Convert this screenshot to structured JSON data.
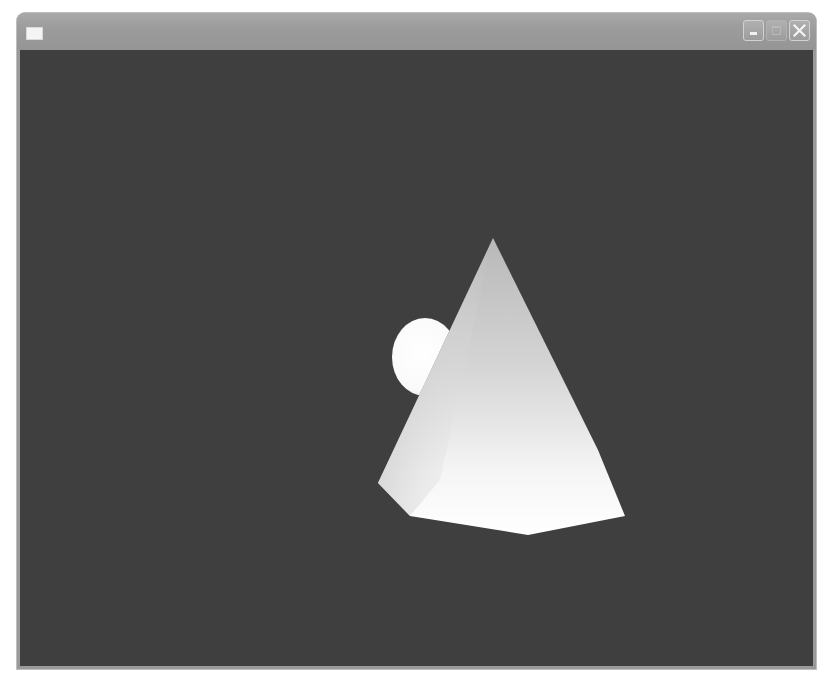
{
  "window": {
    "title": "",
    "app_icon": "window-icon",
    "caption_buttons": [
      {
        "name": "minimize",
        "icon": "minimize-icon",
        "enabled": true
      },
      {
        "name": "maximize",
        "icon": "maximize-icon",
        "enabled": false
      },
      {
        "name": "close",
        "icon": "close-icon",
        "enabled": true
      }
    ]
  },
  "viewport": {
    "background_color": "#3f3f3f",
    "scene": {
      "objects": [
        {
          "type": "cone",
          "color": "#f2f2f2",
          "shading": "gouraud"
        },
        {
          "type": "sphere",
          "color": "#ffffff",
          "shading": "gouraud"
        }
      ]
    }
  },
  "colors": {
    "titlebar": "#9c9c9c",
    "frame": "#9a9a9a",
    "viewport_bg": "#3f3f3f",
    "object_highlight": "#ffffff"
  }
}
